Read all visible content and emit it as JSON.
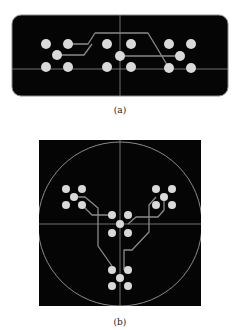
{
  "figure": {
    "background": "#ffffff",
    "panel_color": "#050505",
    "line_color": "#8a8a8a",
    "dot_color": "#d9d9d9",
    "panels": [
      {
        "id": "a",
        "caption": "(a)",
        "shape": "rounded-rectangle",
        "rect": {
          "x": 12,
          "y": 15,
          "w": 216,
          "h": 81,
          "r": 9
        },
        "crosshair": {
          "x": 120,
          "y": 69
        },
        "dot_radius": 5,
        "dot_groups": [
          [
            [
              46,
              44
            ],
            [
              68,
              44
            ],
            [
              57,
              55
            ],
            [
              46,
              67
            ],
            [
              68,
              67
            ]
          ],
          [
            [
              107,
              44
            ],
            [
              131,
              44
            ],
            [
              120,
              56
            ],
            [
              107,
              67
            ],
            [
              131,
              67
            ]
          ],
          [
            [
              169,
              44
            ],
            [
              191,
              44
            ],
            [
              180,
              56
            ],
            [
              169,
              68
            ],
            [
              191,
              68
            ]
          ]
        ],
        "traces": [
          "M68,44 L88,44 L95,33 L148,33 L169,68",
          "M57,55 L84,55 L92,44",
          "M120,56 L180,56"
        ]
      },
      {
        "id": "b",
        "caption": "(b)",
        "shape": "square-with-circle",
        "rect": {
          "x": 39,
          "y": 140,
          "w": 162,
          "h": 166
        },
        "circle": {
          "cx": 120,
          "cy": 224,
          "r": 82
        },
        "crosshair": {
          "x": 120,
          "y": 224
        },
        "dot_radius": 4,
        "dot_groups": [
          [
            [
              66,
              189
            ],
            [
              82,
              189
            ],
            [
              74,
              197
            ],
            [
              66,
              205
            ],
            [
              82,
              205
            ]
          ],
          [
            [
              112,
              215
            ],
            [
              128,
              215
            ],
            [
              120,
              224
            ],
            [
              112,
              233
            ],
            [
              128,
              233
            ]
          ],
          [
            [
              112,
              270
            ],
            [
              128,
              270
            ],
            [
              120,
              278
            ],
            [
              112,
              286
            ],
            [
              128,
              286
            ]
          ],
          [
            [
              156,
              189
            ],
            [
              172,
              189
            ],
            [
              164,
              197
            ],
            [
              156,
              205
            ],
            [
              172,
              205
            ]
          ]
        ],
        "traces": [
          "M74,197 L85,197 L98,208 L98,246 L112,266",
          "M82,205 L92,215 L112,215",
          "M164,197 L164,210 L158,217 L136,217 L128,224",
          "M156,197 L149,205 L149,232 L132,250 L124,250 L124,270"
        ]
      }
    ]
  }
}
